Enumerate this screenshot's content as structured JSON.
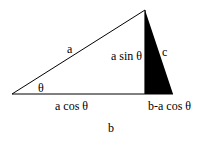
{
  "diagram": {
    "type": "triangle",
    "labels": {
      "hypotenuse": "a",
      "angle": "θ",
      "adjacent": "a cos  θ",
      "height": "a sin θ",
      "side_c": "c",
      "remainder": "b-a cos  θ",
      "base": "b"
    },
    "colors": {
      "stroke": "#000000",
      "fill_shaded": "#000000",
      "background": "#ffffff"
    }
  }
}
